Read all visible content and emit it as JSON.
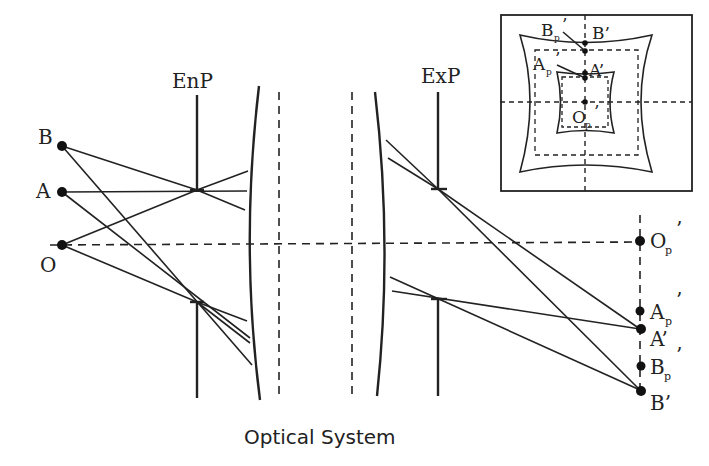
{
  "diagram": {
    "caption": "Optical System",
    "labels": {
      "entrance_pupil": "EnP",
      "exit_pupil": "ExP"
    },
    "object_points": [
      {
        "id": "B",
        "label": "B"
      },
      {
        "id": "A",
        "label": "A"
      },
      {
        "id": "O",
        "label": "O"
      }
    ],
    "image_points": [
      {
        "id": "Op",
        "label": "O",
        "sub": "p",
        "prime": "’"
      },
      {
        "id": "Ap",
        "label": "A",
        "sub": "p",
        "prime": "’"
      },
      {
        "id": "A_img",
        "label": "A’"
      },
      {
        "id": "Bp",
        "label": "B",
        "sub": "p",
        "prime": "’"
      },
      {
        "id": "B_img",
        "label": "B’"
      }
    ],
    "inset": {
      "description": "Pincushion distortion grid",
      "labels": {
        "Bp": {
          "label": "B",
          "sub": "p",
          "prime": "’"
        },
        "B_img": "B’",
        "Ap": {
          "label": "A",
          "sub": "p",
          "prime": "’"
        },
        "A_img": "A’",
        "Op": {
          "label": "O",
          "sub": "p",
          "prime": "’"
        }
      }
    },
    "colors": {
      "stroke": "#222222",
      "background": "#ffffff"
    }
  }
}
